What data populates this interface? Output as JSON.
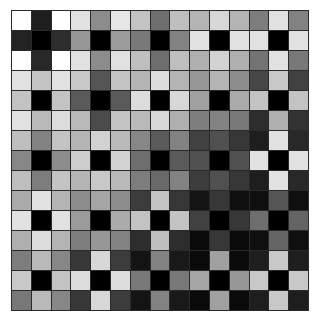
{
  "grid": {
    "rows": 15,
    "cols": 15,
    "gray_values": [
      [
        255,
        30,
        255,
        225,
        140,
        230,
        195,
        110,
        190,
        180,
        215,
        180,
        125,
        225,
        130
      ],
      [
        35,
        0,
        45,
        150,
        0,
        155,
        120,
        0,
        130,
        225,
        0,
        225,
        225,
        0,
        225
      ],
      [
        255,
        40,
        255,
        225,
        140,
        225,
        190,
        110,
        190,
        175,
        210,
        175,
        115,
        225,
        120
      ],
      [
        225,
        195,
        225,
        200,
        85,
        195,
        180,
        220,
        180,
        150,
        180,
        140,
        70,
        200,
        65
      ],
      [
        195,
        0,
        195,
        90,
        0,
        90,
        220,
        0,
        215,
        160,
        0,
        170,
        195,
        0,
        195
      ],
      [
        225,
        185,
        220,
        185,
        75,
        195,
        185,
        215,
        175,
        125,
        130,
        120,
        45,
        175,
        50
      ],
      [
        190,
        130,
        195,
        180,
        210,
        185,
        135,
        90,
        130,
        65,
        80,
        55,
        30,
        225,
        40
      ],
      [
        135,
        0,
        140,
        205,
        0,
        210,
        110,
        0,
        90,
        80,
        0,
        80,
        225,
        0,
        225
      ],
      [
        190,
        125,
        195,
        180,
        200,
        185,
        125,
        105,
        130,
        60,
        80,
        55,
        30,
        225,
        40
      ],
      [
        170,
        225,
        180,
        140,
        165,
        140,
        60,
        195,
        55,
        20,
        55,
        15,
        15,
        85,
        15
      ],
      [
        225,
        0,
        225,
        155,
        0,
        170,
        195,
        0,
        195,
        65,
        0,
        55,
        110,
        0,
        100
      ],
      [
        175,
        220,
        180,
        125,
        150,
        130,
        45,
        190,
        45,
        10,
        55,
        10,
        15,
        100,
        15
      ],
      [
        125,
        185,
        135,
        55,
        215,
        60,
        20,
        130,
        25,
        10,
        160,
        10,
        30,
        200,
        30
      ],
      [
        200,
        0,
        195,
        220,
        0,
        220,
        120,
        0,
        120,
        165,
        0,
        150,
        200,
        0,
        200
      ],
      [
        120,
        185,
        135,
        55,
        215,
        60,
        20,
        130,
        25,
        10,
        160,
        10,
        30,
        200,
        30
      ]
    ],
    "border_color": "#2a2a2a",
    "background_color": "#ffffff"
  }
}
